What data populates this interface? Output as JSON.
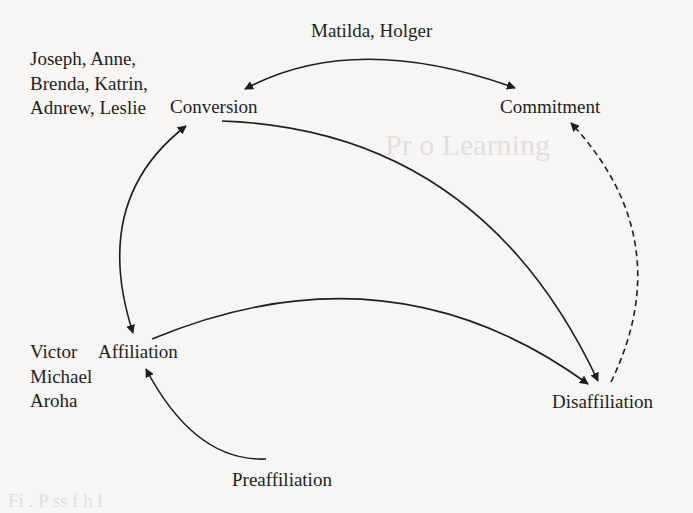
{
  "diagram": {
    "type": "state-transition",
    "nodes": {
      "conversion": "Conversion",
      "commitment": "Commitment",
      "affiliation": "Affiliation",
      "disaffiliation": "Disaffiliation",
      "preaffiliation": "Preaffiliation"
    },
    "annotations": {
      "top_arc_names": "Matilda, Holger",
      "conversion_group": [
        "Joseph, Anne,",
        "Brenda, Katrin,",
        "Adnrew, Leslie"
      ],
      "affiliation_group": [
        "Victor",
        "Michael",
        "Aroha"
      ]
    },
    "edges": [
      {
        "from": "Conversion",
        "to": "Commitment",
        "style": "solid",
        "direction": "bidirectional",
        "label": "Matilda, Holger"
      },
      {
        "from": "Conversion",
        "to": "Disaffiliation",
        "style": "solid",
        "direction": "forward"
      },
      {
        "from": "Affiliation",
        "to": "Conversion",
        "style": "solid",
        "direction": "bidirectional"
      },
      {
        "from": "Affiliation",
        "to": "Disaffiliation",
        "style": "solid",
        "direction": "bidirectional"
      },
      {
        "from": "Preaffiliation",
        "to": "Affiliation",
        "style": "solid",
        "direction": "forward"
      },
      {
        "from": "Disaffiliation",
        "to": "Commitment",
        "style": "dashed",
        "direction": "forward"
      }
    ],
    "colors": {
      "background": "#f7f6f4",
      "ink": "#1e1e1e"
    }
  },
  "background_bleed": {
    "heading_fragment": "Pr     o  Learning",
    "caption_fragment": "Fi  . P    ss   f   h      l"
  }
}
